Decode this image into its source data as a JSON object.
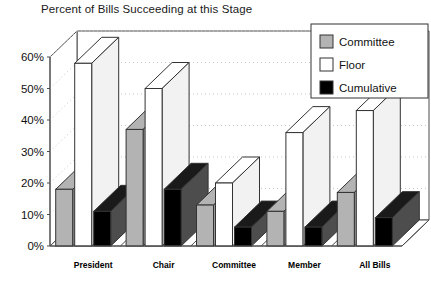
{
  "chart_data": {
    "type": "bar",
    "title": "Percent of Bills Succeeding at this Stage",
    "xlabel": "",
    "ylabel": "",
    "ylim": [
      0,
      60
    ],
    "ytick_labels": [
      "0%",
      "10%",
      "20%",
      "30%",
      "40%",
      "50%",
      "60%"
    ],
    "ytick_values": [
      0,
      10,
      20,
      30,
      40,
      50,
      60
    ],
    "grid": true,
    "legend_position": "top-right",
    "three_d": true,
    "categories": [
      "President",
      "Chair",
      "Committee",
      "Member",
      "All Bills"
    ],
    "series": [
      {
        "name": "Committee",
        "color": "#b3b3b3",
        "values": [
          18,
          37,
          13,
          11,
          17
        ]
      },
      {
        "name": "Floor",
        "color": "#ffffff",
        "values": [
          58,
          50,
          20,
          36,
          43
        ]
      },
      {
        "name": "Cumulative",
        "color": "#000000",
        "values": [
          11,
          18,
          6,
          6,
          9
        ]
      }
    ]
  },
  "legend": {
    "items": [
      {
        "label": "Committee",
        "swatch": "#b3b3b3"
      },
      {
        "label": "Floor",
        "swatch": "#ffffff"
      },
      {
        "label": "Cumulative",
        "swatch": "#000000"
      }
    ]
  },
  "colors": {
    "axis": "#4d4d4d",
    "grid": "#c8c8c8",
    "outline": "#333333",
    "background": "#ffffff",
    "committee_fill": "#b3b3b3",
    "floor_fill": "#ffffff",
    "cumulative_fill": "#000000"
  }
}
